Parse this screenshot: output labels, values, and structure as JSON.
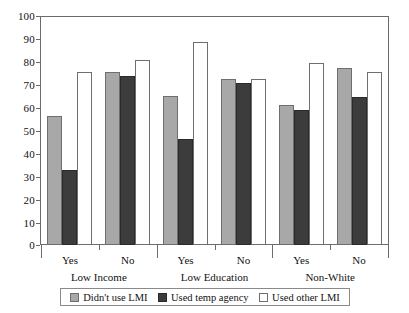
{
  "chart_data": {
    "type": "bar",
    "title": "",
    "subtitle": "",
    "xlabel": "",
    "ylabel": "",
    "ylim": [
      0,
      100
    ],
    "ytick_labels": [
      "100",
      "90",
      "80",
      "70",
      "60",
      "50",
      "40",
      "30",
      "20",
      "10",
      "0"
    ],
    "ytick_values": [
      100,
      90,
      80,
      70,
      60,
      50,
      40,
      30,
      20,
      10,
      0
    ],
    "grid": false,
    "legend_position": "bottom",
    "categories": [
      "Yes",
      "No",
      "Yes",
      "No",
      "Yes",
      "No"
    ],
    "group_labels": [
      "Low Income",
      "Low Education",
      "Non-White"
    ],
    "group_spans": [
      2,
      2,
      2
    ],
    "series": [
      {
        "name": "Didn't use LMI",
        "color": "#a8a8a8",
        "values": [
          56.5,
          76.0,
          65.5,
          73.0,
          61.5,
          77.5
        ]
      },
      {
        "name": "Used temp agency",
        "color": "#3c3c3c",
        "values": [
          32.8,
          74.3,
          46.3,
          71.0,
          59.0,
          65.0
        ]
      },
      {
        "name": "Used other LMI",
        "color": "#ffffff",
        "values": [
          76.0,
          81.0,
          89.0,
          73.0,
          80.0,
          76.0
        ]
      }
    ]
  },
  "legend": {
    "items": [
      {
        "label": "Didn't use LMI",
        "swatch": "light-gray-swatch"
      },
      {
        "label": "Used temp agency",
        "swatch": "dark-gray-swatch"
      },
      {
        "label": "Used other LMI",
        "swatch": "white-swatch"
      }
    ]
  },
  "axis": {
    "y_ticks": [
      "100",
      "90",
      "80",
      "70",
      "60",
      "50",
      "40",
      "30",
      "20",
      "10",
      "0"
    ],
    "x_ticks": [
      "Yes",
      "No",
      "Yes",
      "No",
      "Yes",
      "No"
    ],
    "x_groups": [
      "Low Income",
      "Low Education",
      "Non-White"
    ]
  }
}
